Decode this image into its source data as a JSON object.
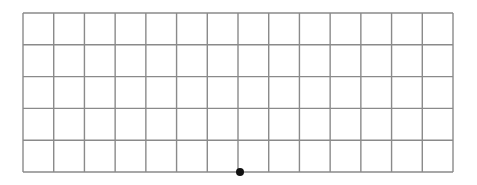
{
  "diagram": {
    "type": "grid",
    "columns": 14,
    "rows": 5,
    "left": 23,
    "top": 13,
    "right": 453,
    "bottom": 172,
    "line_color": "#8a8a8a",
    "background": "#ffffff",
    "point": {
      "x": 240,
      "y": 172,
      "radius": 4,
      "color": "#111111",
      "label": ""
    }
  }
}
